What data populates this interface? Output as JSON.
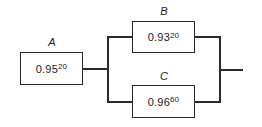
{
  "diagram": {
    "type": "reliability-block-diagram",
    "blocks": [
      {
        "id": "A",
        "label": "A",
        "base": "0.95",
        "exponent": "20"
      },
      {
        "id": "B",
        "label": "B",
        "base": "0.93",
        "exponent": "20"
      },
      {
        "id": "C",
        "label": "C",
        "base": "0.96",
        "exponent": "60"
      }
    ],
    "connections": [
      {
        "from": "A",
        "to": "B/C parallel group"
      },
      {
        "from": "B/C parallel group",
        "to": "output"
      }
    ],
    "structure": "A in series with (B parallel C)",
    "colors": {
      "line": "#2a2a2a",
      "background": "#ffffff"
    }
  }
}
